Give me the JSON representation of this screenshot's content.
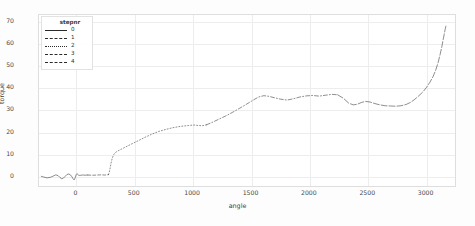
{
  "chart_data": {
    "type": "line",
    "title": "",
    "xlabel": "angle",
    "ylabel": "torque",
    "xlim": [
      -320,
      3260
    ],
    "ylim": [
      -5,
      73
    ],
    "grid": true,
    "xticks": [
      0,
      500,
      1000,
      1500,
      2000,
      2500,
      3000
    ],
    "xtick_labels": [
      "0",
      "500",
      "1000",
      "1500",
      "2000",
      "2500",
      "3000"
    ],
    "yticks": [
      0,
      10,
      20,
      30,
      40,
      50,
      60,
      70
    ],
    "ytick_labels": [
      "0",
      "10",
      "20",
      "30",
      "40",
      "50",
      "60",
      "70"
    ],
    "legend": {
      "title": "stepnr",
      "position": "upper-left-inside",
      "entries": [
        {
          "label": "0",
          "style": "solid",
          "color": "#2b2b2b"
        },
        {
          "label": "1",
          "style": "dashed",
          "color": "#2b2b2b"
        },
        {
          "label": "2",
          "style": "dotted",
          "color": "#2b2b2b"
        },
        {
          "label": "3",
          "style": "dashdot",
          "color": "#2b2b2b"
        },
        {
          "label": "4",
          "style": "longdash",
          "color": "#2b2b2b"
        }
      ]
    },
    "series": [
      {
        "name": "0",
        "stepnr": 0,
        "style": "solid",
        "x": [
          -300,
          -280,
          -250,
          -220,
          -195,
          -175,
          -155,
          -140,
          -125,
          -110,
          -95,
          -80,
          -65,
          -50,
          -38,
          -28,
          -18,
          -10,
          -4,
          0,
          6,
          14,
          22,
          30,
          40,
          52,
          64,
          76,
          88,
          100
        ],
        "y": [
          -0.6,
          -0.9,
          -1.3,
          -1.0,
          -0.4,
          0.1,
          -0.3,
          -1.1,
          -1.7,
          -1.4,
          -0.6,
          0.2,
          0.5,
          0.1,
          -0.7,
          -1.6,
          -2.2,
          -1.4,
          -0.5,
          0.2,
          0.6,
          0.3,
          -0.1,
          -0.2,
          -0.1,
          0.0,
          0.0,
          -0.1,
          0.0,
          0.0
        ]
      },
      {
        "name": "1",
        "stepnr": 1,
        "style": "dashed",
        "x": [
          100,
          140,
          180,
          215,
          245,
          268,
          278
        ],
        "y": [
          0.0,
          -0.1,
          0.0,
          0.1,
          0.0,
          0.1,
          0.2
        ]
      },
      {
        "name": "2",
        "stepnr": 2,
        "style": "dotted",
        "x": [
          278,
          285,
          292,
          300,
          310,
          322,
          336,
          352,
          370,
          392,
          418,
          448,
          482,
          520,
          562,
          608,
          658,
          712,
          770,
          832,
          898,
          968,
          1015,
          1050,
          1085,
          1120
        ],
        "y": [
          0.2,
          1.4,
          3.2,
          5.4,
          7.6,
          9.2,
          10.2,
          10.8,
          11.3,
          11.9,
          12.6,
          13.4,
          14.3,
          15.3,
          16.4,
          17.6,
          18.8,
          19.9,
          20.8,
          21.6,
          22.2,
          22.6,
          22.8,
          22.6,
          22.5,
          22.9
        ]
      },
      {
        "name": "3",
        "stepnr": 3,
        "style": "dashdot",
        "x": [
          1120,
          1170,
          1225,
          1285,
          1345,
          1405,
          1450,
          1490,
          1530,
          1570,
          1615,
          1660,
          1710,
          1760,
          1815,
          1870,
          1925,
          1980,
          2035,
          2090,
          2145,
          2200,
          2250
        ],
        "y": [
          22.9,
          24.0,
          25.4,
          26.9,
          28.6,
          30.4,
          31.8,
          33.1,
          34.4,
          35.6,
          36.2,
          35.9,
          35.2,
          34.6,
          34.2,
          34.8,
          35.6,
          36.1,
          36.3,
          36.0,
          36.4,
          36.8,
          36.6
        ]
      },
      {
        "name": "4",
        "stepnr": 4,
        "style": "longdash",
        "x": [
          2250,
          2300,
          2345,
          2385,
          2420,
          2455,
          2490,
          2530,
          2570,
          2615,
          2660,
          2705,
          2750,
          2795,
          2840,
          2880,
          2915,
          2950,
          2985,
          3015,
          3045,
          3072,
          3095,
          3115,
          3132,
          3147,
          3158,
          3168,
          3175,
          3180,
          3184
        ],
        "y": [
          36.6,
          35.0,
          32.8,
          32.0,
          32.3,
          33.1,
          33.6,
          33.3,
          32.6,
          32.0,
          31.6,
          31.5,
          31.4,
          31.6,
          32.2,
          33.2,
          34.6,
          36.2,
          38.0,
          40.0,
          42.4,
          45.0,
          48.0,
          51.4,
          55.0,
          58.6,
          61.8,
          64.4,
          66.4,
          67.6,
          68.4
        ]
      }
    ],
    "annotations": [
      {
        "text": "flat baseline with oscillation near angle 0, torque about -2 to 0.6"
      },
      {
        "text": "steep onset at angle ~280 rising to torque ~11"
      },
      {
        "text": "plateau shoulder near angle 1000-1120 at torque ~22.5"
      },
      {
        "text": "broad plateau angle 1500-2900 at torque ~31 to 37"
      },
      {
        "text": "final exponential rise to torque ~68 at angle ~3180"
      }
    ]
  }
}
